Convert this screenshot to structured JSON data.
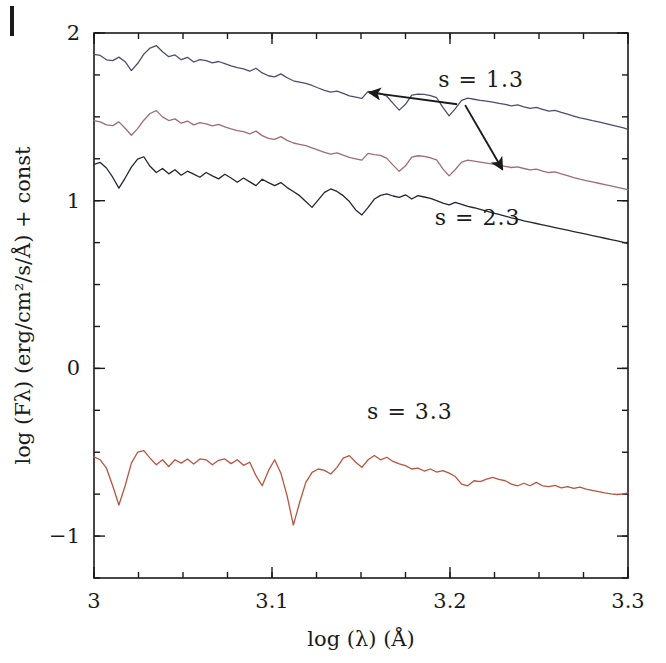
{
  "figure": {
    "title": "",
    "background_color": "#ffffff",
    "axis_color": "#1a1a1a"
  },
  "chart_data": {
    "type": "line",
    "title": "",
    "subtitle": "",
    "xlabel": "log (λ) (Å)",
    "ylabel": "log (Fλ) (erg/cm²/s/Å) + const",
    "xlim": [
      3.0,
      3.3
    ],
    "ylim": [
      -1.25,
      2.0
    ],
    "xticks": [
      3.0,
      3.1,
      3.2,
      3.3
    ],
    "xticklabels": [
      "3",
      "3.1",
      "3.2",
      "3.3"
    ],
    "yticks": [
      -1,
      0,
      1,
      2
    ],
    "yticklabels": [
      "−1",
      "0",
      "1",
      "2"
    ],
    "x_minor_tick_step": 0.025,
    "y_minor_tick_step": 0.25,
    "grid": false,
    "legend": "none",
    "tick_direction": "in",
    "annotations": [
      {
        "text": "s  =  1.3",
        "x": 3.2175,
        "y": 1.676,
        "name": "annotation-s-1-3"
      },
      {
        "text": "s  =  2.3",
        "x": 3.2155,
        "y": 0.857,
        "name": "annotation-s-2-3"
      },
      {
        "text": "s  =  3.3",
        "x": 3.1775,
        "y": -0.3,
        "name": "annotation-s-3-3"
      }
    ],
    "arrows": [
      {
        "from": [
          3.204,
          1.575
        ],
        "to": [
          3.1545,
          1.646
        ],
        "name": "arrow-to-top-curve"
      },
      {
        "from": [
          3.2085,
          1.57
        ],
        "to": [
          3.2295,
          1.186
        ],
        "name": "arrow-to-middle-curve"
      }
    ],
    "series": [
      {
        "name": "s = 1.3 (upper)",
        "color": "#4b4f6e",
        "linewidth": 1.3,
        "label": "s = 1.3",
        "x": [
          3.0,
          3.0035,
          3.007,
          3.0105,
          3.014,
          3.0175,
          3.021,
          3.0245,
          3.028,
          3.0315,
          3.035,
          3.0385,
          3.042,
          3.0455,
          3.049,
          3.0525,
          3.056,
          3.0595,
          3.063,
          3.0665,
          3.07,
          3.0735,
          3.077,
          3.0805,
          3.084,
          3.0875,
          3.091,
          3.0945,
          3.098,
          3.1015,
          3.105,
          3.1085,
          3.112,
          3.1155,
          3.119,
          3.1225,
          3.126,
          3.1295,
          3.133,
          3.1365,
          3.14,
          3.1435,
          3.147,
          3.1505,
          3.154,
          3.1575,
          3.161,
          3.1645,
          3.168,
          3.1715,
          3.175,
          3.1785,
          3.182,
          3.1855,
          3.189,
          3.1925,
          3.196,
          3.1995,
          3.203,
          3.2065,
          3.21,
          3.2135,
          3.217,
          3.2205,
          3.224,
          3.2275,
          3.231,
          3.2345,
          3.238,
          3.2415,
          3.245,
          3.2485,
          3.252,
          3.2555,
          3.259,
          3.2625,
          3.266,
          3.2695,
          3.273,
          3.2765,
          3.28,
          3.2835,
          3.287,
          3.2905,
          3.294,
          3.2975,
          3.3
        ],
        "y": [
          1.873,
          1.866,
          1.84,
          1.835,
          1.856,
          1.829,
          1.776,
          1.818,
          1.874,
          1.91,
          1.925,
          1.888,
          1.859,
          1.869,
          1.841,
          1.855,
          1.827,
          1.841,
          1.835,
          1.822,
          1.83,
          1.817,
          1.804,
          1.793,
          1.786,
          1.772,
          1.79,
          1.762,
          1.745,
          1.738,
          1.756,
          1.733,
          1.715,
          1.707,
          1.699,
          1.687,
          1.672,
          1.658,
          1.648,
          1.654,
          1.64,
          1.625,
          1.618,
          1.61,
          1.652,
          1.645,
          1.64,
          1.623,
          1.58,
          1.54,
          1.575,
          1.63,
          1.636,
          1.634,
          1.627,
          1.614,
          1.556,
          1.506,
          1.549,
          1.598,
          1.611,
          1.605,
          1.598,
          1.594,
          1.588,
          1.58,
          1.574,
          1.566,
          1.571,
          1.56,
          1.551,
          1.556,
          1.545,
          1.534,
          1.539,
          1.527,
          1.516,
          1.505,
          1.494,
          1.487,
          1.478,
          1.47,
          1.461,
          1.452,
          1.443,
          1.434,
          1.425
        ]
      },
      {
        "name": "s = 2.3 (middle)",
        "color": "#9e6d74",
        "linewidth": 1.3,
        "label": "s = 2.3",
        "x": [
          3.0,
          3.0035,
          3.007,
          3.0105,
          3.014,
          3.0175,
          3.021,
          3.0245,
          3.028,
          3.0315,
          3.035,
          3.0385,
          3.042,
          3.0455,
          3.049,
          3.0525,
          3.056,
          3.0595,
          3.063,
          3.0665,
          3.07,
          3.0735,
          3.077,
          3.0805,
          3.084,
          3.0875,
          3.091,
          3.0945,
          3.098,
          3.1015,
          3.105,
          3.1085,
          3.112,
          3.1155,
          3.119,
          3.1225,
          3.126,
          3.1295,
          3.133,
          3.1365,
          3.14,
          3.1435,
          3.147,
          3.1505,
          3.154,
          3.1575,
          3.161,
          3.1645,
          3.168,
          3.1715,
          3.175,
          3.1785,
          3.182,
          3.1855,
          3.189,
          3.1925,
          3.196,
          3.1995,
          3.203,
          3.2065,
          3.21,
          3.2135,
          3.217,
          3.2205,
          3.224,
          3.2275,
          3.231,
          3.2345,
          3.238,
          3.2415,
          3.245,
          3.2485,
          3.252,
          3.2555,
          3.259,
          3.2625,
          3.266,
          3.2695,
          3.273,
          3.2765,
          3.28,
          3.2835,
          3.287,
          3.2905,
          3.294,
          3.2975,
          3.3
        ],
        "y": [
          1.478,
          1.47,
          1.452,
          1.448,
          1.47,
          1.432,
          1.39,
          1.43,
          1.48,
          1.52,
          1.537,
          1.5,
          1.478,
          1.488,
          1.462,
          1.475,
          1.452,
          1.465,
          1.458,
          1.446,
          1.455,
          1.44,
          1.428,
          1.418,
          1.412,
          1.398,
          1.415,
          1.388,
          1.372,
          1.366,
          1.382,
          1.36,
          1.344,
          1.336,
          1.328,
          1.315,
          1.302,
          1.288,
          1.278,
          1.285,
          1.272,
          1.258,
          1.25,
          1.242,
          1.282,
          1.275,
          1.27,
          1.252,
          1.212,
          1.175,
          1.208,
          1.26,
          1.268,
          1.264,
          1.256,
          1.244,
          1.19,
          1.148,
          1.186,
          1.23,
          1.242,
          1.236,
          1.23,
          1.224,
          1.218,
          1.212,
          1.205,
          1.198,
          1.202,
          1.192,
          1.184,
          1.188,
          1.177,
          1.168,
          1.172,
          1.16,
          1.149,
          1.138,
          1.128,
          1.12,
          1.112,
          1.104,
          1.096,
          1.088,
          1.08,
          1.072,
          1.064
        ]
      },
      {
        "name": "s = 3.3 (lower pair - dark)",
        "color": "#232633",
        "linewidth": 1.3,
        "label": "s = 2.3 curve",
        "x": [
          3.0,
          3.0035,
          3.007,
          3.0105,
          3.014,
          3.0175,
          3.021,
          3.0245,
          3.028,
          3.0315,
          3.035,
          3.0385,
          3.042,
          3.0455,
          3.049,
          3.0525,
          3.056,
          3.0595,
          3.063,
          3.0665,
          3.07,
          3.0735,
          3.077,
          3.0805,
          3.084,
          3.0875,
          3.091,
          3.0945,
          3.098,
          3.1015,
          3.105,
          3.1085,
          3.112,
          3.1155,
          3.119,
          3.1225,
          3.126,
          3.1295,
          3.133,
          3.1365,
          3.14,
          3.1435,
          3.147,
          3.1505,
          3.154,
          3.1575,
          3.161,
          3.1645,
          3.168,
          3.1715,
          3.175,
          3.1785,
          3.182,
          3.1855,
          3.189,
          3.1925,
          3.196,
          3.1995,
          3.203,
          3.2065,
          3.21,
          3.2135,
          3.217,
          3.2205,
          3.224,
          3.2275,
          3.231,
          3.2345,
          3.238,
          3.2415,
          3.245,
          3.2485,
          3.252,
          3.2555,
          3.259,
          3.2625,
          3.266,
          3.2695,
          3.273,
          3.2765,
          3.28,
          3.2835,
          3.287,
          3.2905,
          3.294,
          3.2975,
          3.3
        ],
        "y": [
          1.216,
          1.228,
          1.195,
          1.14,
          1.075,
          1.135,
          1.2,
          1.248,
          1.262,
          1.205,
          1.168,
          1.192,
          1.16,
          1.185,
          1.152,
          1.176,
          1.158,
          1.14,
          1.168,
          1.148,
          1.13,
          1.158,
          1.135,
          1.11,
          1.135,
          1.112,
          1.09,
          1.128,
          1.108,
          1.09,
          1.108,
          1.078,
          1.055,
          1.03,
          0.995,
          0.96,
          1.005,
          1.05,
          1.07,
          1.055,
          1.03,
          0.995,
          0.945,
          0.915,
          0.96,
          1.01,
          1.032,
          1.04,
          1.028,
          1.02,
          1.035,
          1.01,
          1.03,
          1.022,
          1.014,
          1.0,
          0.985,
          0.975,
          0.99,
          0.978,
          0.966,
          0.958,
          0.948,
          0.938,
          0.928,
          0.918,
          0.908,
          0.898,
          0.89,
          0.88,
          0.872,
          0.864,
          0.856,
          0.848,
          0.84,
          0.832,
          0.824,
          0.816,
          0.808,
          0.8,
          0.792,
          0.784,
          0.776,
          0.768,
          0.76,
          0.752,
          0.744
        ]
      },
      {
        "name": "s = 3.3 (bottom)",
        "color": "#b5553f",
        "linewidth": 1.3,
        "label": "s = 3.3",
        "x": [
          3.0,
          3.0035,
          3.007,
          3.0105,
          3.014,
          3.0175,
          3.021,
          3.0245,
          3.028,
          3.0315,
          3.035,
          3.0385,
          3.042,
          3.0455,
          3.049,
          3.0525,
          3.056,
          3.0595,
          3.063,
          3.0665,
          3.07,
          3.0735,
          3.077,
          3.0805,
          3.084,
          3.0875,
          3.091,
          3.0945,
          3.098,
          3.1015,
          3.105,
          3.1085,
          3.112,
          3.1155,
          3.119,
          3.1225,
          3.126,
          3.1295,
          3.133,
          3.1365,
          3.14,
          3.1435,
          3.147,
          3.1505,
          3.154,
          3.1575,
          3.161,
          3.1645,
          3.168,
          3.1715,
          3.175,
          3.1785,
          3.182,
          3.1855,
          3.189,
          3.1925,
          3.196,
          3.1995,
          3.203,
          3.2065,
          3.21,
          3.2135,
          3.217,
          3.2205,
          3.224,
          3.2275,
          3.231,
          3.2345,
          3.238,
          3.2415,
          3.245,
          3.2485,
          3.252,
          3.2555,
          3.259,
          3.2625,
          3.266,
          3.2695,
          3.273,
          3.2765,
          3.28,
          3.2835,
          3.287,
          3.2905,
          3.294,
          3.2975,
          3.3
        ],
        "y": [
          -0.528,
          -0.545,
          -0.595,
          -0.7,
          -0.815,
          -0.7,
          -0.565,
          -0.5,
          -0.49,
          -0.535,
          -0.575,
          -0.545,
          -0.585,
          -0.545,
          -0.565,
          -0.54,
          -0.57,
          -0.54,
          -0.545,
          -0.575,
          -0.548,
          -0.54,
          -0.568,
          -0.545,
          -0.578,
          -0.56,
          -0.64,
          -0.7,
          -0.61,
          -0.545,
          -0.625,
          -0.76,
          -0.935,
          -0.8,
          -0.68,
          -0.62,
          -0.6,
          -0.608,
          -0.63,
          -0.59,
          -0.535,
          -0.52,
          -0.56,
          -0.59,
          -0.545,
          -0.52,
          -0.545,
          -0.53,
          -0.555,
          -0.57,
          -0.58,
          -0.6,
          -0.595,
          -0.612,
          -0.6,
          -0.618,
          -0.61,
          -0.625,
          -0.645,
          -0.69,
          -0.7,
          -0.67,
          -0.675,
          -0.66,
          -0.65,
          -0.662,
          -0.67,
          -0.69,
          -0.7,
          -0.685,
          -0.7,
          -0.68,
          -0.7,
          -0.705,
          -0.698,
          -0.712,
          -0.705,
          -0.715,
          -0.708,
          -0.72,
          -0.728,
          -0.735,
          -0.742,
          -0.748,
          -0.752,
          -0.748,
          -0.742
        ]
      }
    ]
  }
}
